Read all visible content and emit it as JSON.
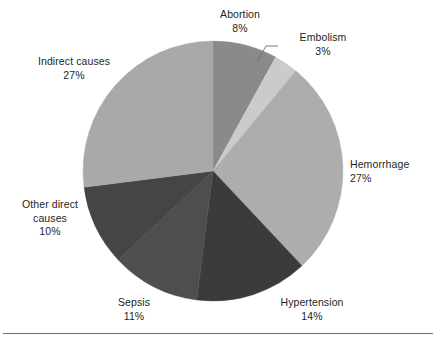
{
  "chart_data": {
    "type": "pie",
    "title": "",
    "subtitle": "",
    "xlabel": "",
    "ylabel": "",
    "legend_position": "none",
    "grid": false,
    "start_angle_deg": 0,
    "direction": "clockwise",
    "center": {
      "cx": 213,
      "cy": 171,
      "r": 130
    },
    "categories": [
      "Abortion",
      "Embolism",
      "Hemorrhage",
      "Hypertension",
      "Sepsis",
      "Other direct causes",
      "Indirect causes"
    ],
    "values": [
      8,
      3,
      27,
      14,
      11,
      10,
      27
    ],
    "value_unit": "%",
    "colors": [
      "#8a8a8a",
      "#cbcbcb",
      "#adadad",
      "#3b3b3b",
      "#4e4e4e",
      "#454545",
      "#a9a9a9"
    ],
    "slices": [
      {
        "label": "Abortion",
        "value": 8,
        "value_text": "8%",
        "color": "#8a8a8a",
        "leader_line": false
      },
      {
        "label": "Embolism",
        "value": 3,
        "value_text": "3%",
        "color": "#cbcbcb",
        "leader_line": true
      },
      {
        "label": "Hemorrhage",
        "value": 27,
        "value_text": "27%",
        "color": "#adadad",
        "leader_line": false
      },
      {
        "label": "Hypertension",
        "value": 14,
        "value_text": "14%",
        "color": "#3b3b3b",
        "leader_line": false
      },
      {
        "label": "Sepsis",
        "value": 11,
        "value_text": "11%",
        "color": "#4e4e4e",
        "leader_line": false
      },
      {
        "label": "Other direct causes",
        "value": 10,
        "value_text": "10%",
        "color": "#454545",
        "leader_line": false,
        "label_line_1": "Other direct",
        "label_line_2": "causes"
      },
      {
        "label": "Indirect causes",
        "value": 27,
        "value_text": "27%",
        "color": "#a9a9a9",
        "leader_line": false
      }
    ]
  },
  "figure": {
    "background_color": "#ffffff",
    "text_color": "#231f20",
    "rule_color": "#6e6e6e"
  }
}
